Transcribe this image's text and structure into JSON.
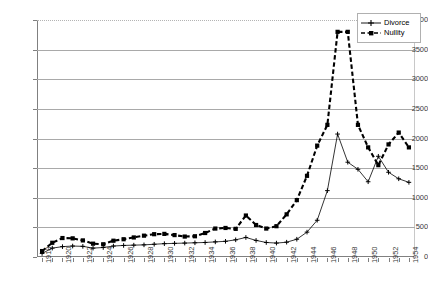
{
  "chart_data": {
    "type": "line",
    "title": "",
    "xlabel": "",
    "ylabel": "",
    "ylim": [
      0,
      4000
    ],
    "ytick_step": 500,
    "yticks": [
      0,
      500,
      1000,
      1500,
      2000,
      2500,
      3000,
      3500,
      4000
    ],
    "grid": true,
    "legend_position": "top-right",
    "x": [
      1918,
      1919,
      1920,
      1921,
      1922,
      1923,
      1924,
      1925,
      1926,
      1927,
      1928,
      1929,
      1930,
      1931,
      1932,
      1933,
      1934,
      1935,
      1936,
      1937,
      1938,
      1939,
      1940,
      1941,
      1942,
      1943,
      1944,
      1945,
      1946,
      1947,
      1948,
      1949,
      1950,
      1951,
      1952,
      1953,
      1954
    ],
    "xtick_labels": [
      "1918",
      "1920",
      "1922",
      "1924",
      "1926",
      "1928",
      "1930",
      "1932",
      "1934",
      "1936",
      "1938",
      "1940",
      "1942",
      "1944",
      "1946",
      "1948",
      "1950",
      "1952",
      "1954"
    ],
    "series": [
      {
        "name": "Divorce",
        "style": "solid",
        "marker": "plus",
        "color": "#000000",
        "values": [
          60,
          150,
          175,
          185,
          180,
          150,
          160,
          185,
          195,
          200,
          205,
          215,
          225,
          230,
          235,
          240,
          245,
          255,
          265,
          290,
          330,
          280,
          245,
          235,
          250,
          300,
          420,
          620,
          1120,
          2075,
          1600,
          1480,
          1270,
          1700,
          1430,
          1320,
          1260
        ]
      },
      {
        "name": "Nullity",
        "style": "dashed",
        "marker": "square",
        "color": "#000000",
        "values": [
          100,
          240,
          320,
          315,
          280,
          225,
          215,
          275,
          300,
          330,
          360,
          385,
          390,
          370,
          345,
          350,
          405,
          480,
          490,
          475,
          700,
          540,
          480,
          520,
          720,
          960,
          1370,
          1880,
          2230,
          3800,
          3800,
          2230,
          1850,
          1550,
          1900,
          2100,
          1850
        ]
      }
    ]
  },
  "legend": {
    "items": [
      {
        "label": "Divorce",
        "style": "solid",
        "marker": "plus"
      },
      {
        "label": "Nullity",
        "style": "dashed",
        "marker": "square"
      }
    ]
  },
  "axes": {
    "y_max": 4000,
    "y_min": 0
  }
}
